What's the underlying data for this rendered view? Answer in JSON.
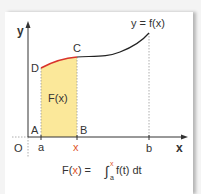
{
  "figure": {
    "curve_label": "y = f(x)",
    "axis_y_label": "y",
    "axis_x_label": "x",
    "origin_label": "O",
    "point_labels": {
      "A": "A",
      "B": "B",
      "C": "C",
      "D": "D"
    },
    "tick_labels": {
      "a": "a",
      "x": "x",
      "b": "b"
    },
    "area_label": "F(x)",
    "formula": {
      "lhs_F": "F(",
      "lhs_x": "x",
      "lhs_close": ") =",
      "integral": "∫",
      "upper": "x",
      "lower": "a",
      "integrand": "f(t) dt"
    },
    "colors": {
      "fill": "#fbe89a",
      "highlight_curve": "#d9332b",
      "accent_x": "#e0552a",
      "curve": "#222222",
      "axis": "#333333"
    }
  }
}
